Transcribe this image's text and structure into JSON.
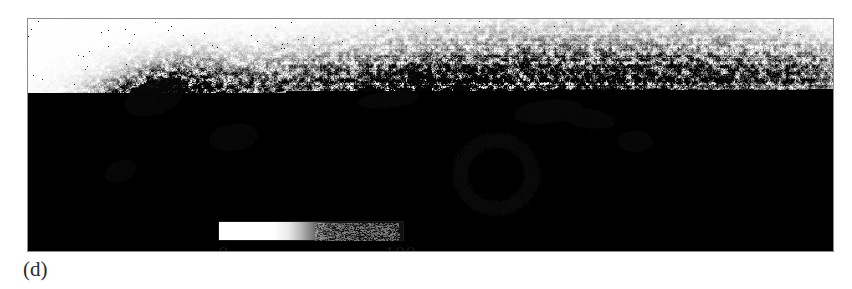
{
  "figure": {
    "panel_label": "(d)",
    "image_kind": "grayscale-micrograph"
  },
  "scalebar": {
    "min_label": "0",
    "max_label": "100",
    "gradient_from": "#ffffff",
    "gradient_to": "#101010",
    "border_color": "#1a1a1a"
  },
  "frame": {
    "border_color": "#8c8c8c",
    "background": "#ffffff"
  },
  "chart_data": {
    "type": "heatmap",
    "title": "",
    "xlabel": "",
    "ylabel": "",
    "colorbar": {
      "label": "",
      "ticks": [
        0,
        100
      ],
      "tick_labels": [
        "0",
        "100"
      ],
      "range": [
        0,
        100
      ],
      "colormap": "grayscale-inverted",
      "orientation": "horizontal"
    },
    "grid": false,
    "legend_position": "inside-bottom-left"
  }
}
